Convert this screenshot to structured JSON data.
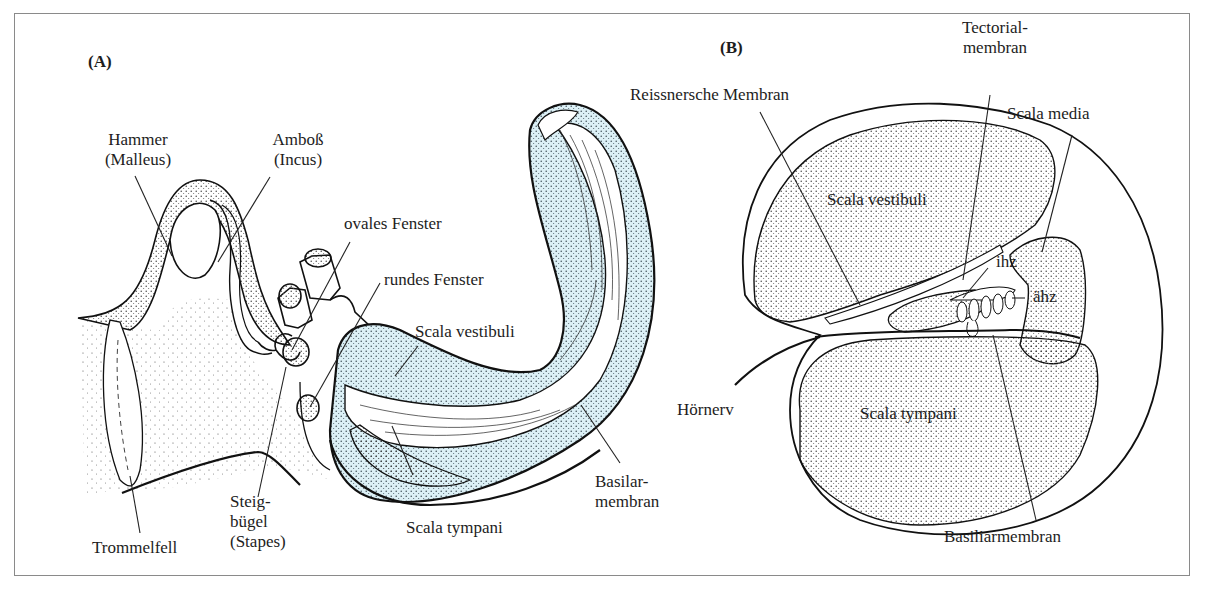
{
  "figure": {
    "panels": [
      {
        "id": "A",
        "tag": "(A)",
        "labels": {
          "hammer": [
            "Hammer",
            "(Malleus)"
          ],
          "amboss": [
            "Amboß",
            "(Incus)"
          ],
          "ovales_fenster": "ovales Fenster",
          "rundes_fenster": "rundes Fenster",
          "scala_vestibuli": "Scala vestibuli",
          "steigbuegel": [
            "Steig-",
            "bügel",
            "(Stapes)"
          ],
          "trommelfell": "Trommelfell",
          "scala_tympani": "Scala tympani",
          "basilarmembran": [
            "Basilar-",
            "membran"
          ]
        }
      },
      {
        "id": "B",
        "tag": "(B)",
        "labels": {
          "reissner": "Reissnersche Membran",
          "tectorial": [
            "Tectorial-",
            "membran"
          ],
          "scala_media": "Scala media",
          "scala_vestibuli": "Scala vestibuli",
          "ihz": "ihz",
          "aehz": "ähz",
          "hoernerv": "Hörnerv",
          "scala_tympani": "Scala tympani",
          "basiliarmembran": "Basiliarmembran"
        }
      }
    ],
    "colors": {
      "fluid_fill": "#dcf0f6",
      "stipple": "#2a2a2a",
      "outline": "#111111",
      "frame": "#8a8a8a"
    }
  }
}
